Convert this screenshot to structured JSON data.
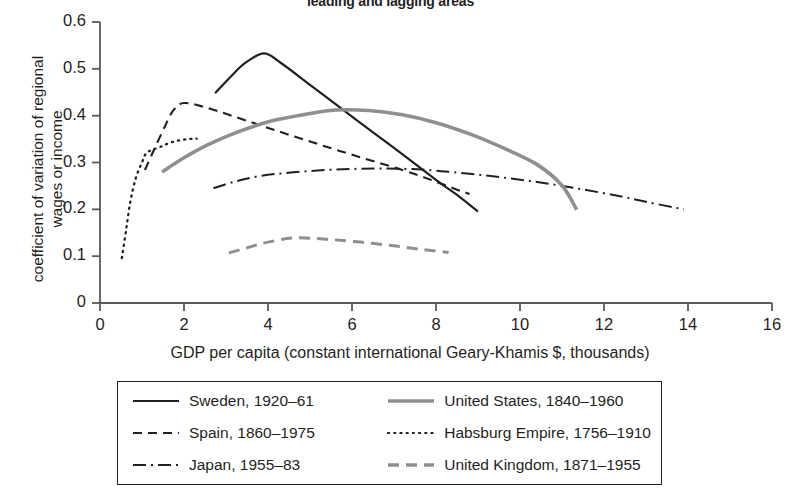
{
  "chart_data": {
    "type": "line",
    "title": "leading and lagging areas",
    "xlabel": "GDP per capita (constant international Geary-Khamis $, thousands)",
    "ylabel_line1": "coefficient of variation of regional",
    "ylabel_line2": "wages or income",
    "xlim": [
      0,
      16
    ],
    "ylim": [
      0,
      0.6
    ],
    "xticks": [
      "0",
      "2",
      "4",
      "6",
      "8",
      "10",
      "12",
      "14",
      "16"
    ],
    "xtick_values": [
      0,
      2,
      4,
      6,
      8,
      10,
      12,
      14,
      16
    ],
    "yticks": [
      "0",
      "0.1",
      "0.2",
      "0.3",
      "0.4",
      "0.5",
      "0.6"
    ],
    "ytick_values": [
      0,
      0.1,
      0.2,
      0.3,
      0.4,
      0.5,
      0.6
    ],
    "grid": false,
    "legend_position": "below-axes",
    "series": [
      {
        "name": "Sweden, 1920–61",
        "style": "solid",
        "color": "#231f20",
        "width": 2.2,
        "points": [
          [
            2.74,
            0.448
          ],
          [
            3.1,
            0.482
          ],
          [
            3.45,
            0.512
          ],
          [
            3.9,
            0.533
          ],
          [
            4.3,
            0.513
          ],
          [
            5.0,
            0.466
          ],
          [
            6.0,
            0.398
          ],
          [
            7.0,
            0.331
          ],
          [
            8.0,
            0.263
          ],
          [
            8.6,
            0.224
          ],
          [
            9.0,
            0.195
          ]
        ]
      },
      {
        "name": "Spain, 1860–1975",
        "style": "dashed",
        "color": "#231f20",
        "width": 2.1,
        "points": [
          [
            1.07,
            0.284
          ],
          [
            1.3,
            0.33
          ],
          [
            1.55,
            0.378
          ],
          [
            1.75,
            0.412
          ],
          [
            2.0,
            0.427
          ],
          [
            2.5,
            0.418
          ],
          [
            3.2,
            0.398
          ],
          [
            4.2,
            0.368
          ],
          [
            5.2,
            0.339
          ],
          [
            6.2,
            0.311
          ],
          [
            7.2,
            0.284
          ],
          [
            8.0,
            0.259
          ],
          [
            8.5,
            0.242
          ],
          [
            8.8,
            0.233
          ]
        ]
      },
      {
        "name": "Japan, 1955–83",
        "style": "dashdot",
        "color": "#231f20",
        "width": 2.0,
        "points": [
          [
            2.7,
            0.245
          ],
          [
            3.2,
            0.259
          ],
          [
            3.8,
            0.271
          ],
          [
            4.6,
            0.279
          ],
          [
            5.6,
            0.285
          ],
          [
            6.6,
            0.287
          ],
          [
            7.4,
            0.286
          ],
          [
            8.2,
            0.281
          ],
          [
            9.2,
            0.272
          ],
          [
            10.2,
            0.261
          ],
          [
            11.2,
            0.247
          ],
          [
            12.2,
            0.231
          ],
          [
            13.0,
            0.216
          ],
          [
            13.9,
            0.2
          ]
        ]
      },
      {
        "name": "United States, 1840–1960",
        "style": "solid",
        "color": "#8f8f8f",
        "width": 3.6,
        "points": [
          [
            1.48,
            0.28
          ],
          [
            2.0,
            0.31
          ],
          [
            2.6,
            0.339
          ],
          [
            3.3,
            0.366
          ],
          [
            4.1,
            0.389
          ],
          [
            4.9,
            0.403
          ],
          [
            5.6,
            0.412
          ],
          [
            6.4,
            0.411
          ],
          [
            7.2,
            0.402
          ],
          [
            8.0,
            0.385
          ],
          [
            8.8,
            0.361
          ],
          [
            9.6,
            0.331
          ],
          [
            10.4,
            0.296
          ],
          [
            11.0,
            0.251
          ],
          [
            11.35,
            0.199
          ]
        ]
      },
      {
        "name": "Habsburg Empire, 1756–1910",
        "style": "dotted",
        "color": "#231f20",
        "width": 2.3,
        "points": [
          [
            0.52,
            0.096
          ],
          [
            0.62,
            0.155
          ],
          [
            0.72,
            0.215
          ],
          [
            0.85,
            0.266
          ],
          [
            1.0,
            0.3
          ],
          [
            1.1,
            0.32
          ],
          [
            1.25,
            0.327
          ],
          [
            1.45,
            0.334
          ],
          [
            1.7,
            0.343
          ],
          [
            2.0,
            0.349
          ],
          [
            2.3,
            0.351
          ]
        ]
      },
      {
        "name": "United Kingdom, 1871–1955",
        "style": "dashed",
        "color": "#8f8f8f",
        "width": 3.0,
        "points": [
          [
            3.07,
            0.107
          ],
          [
            3.5,
            0.118
          ],
          [
            4.0,
            0.13
          ],
          [
            4.65,
            0.139
          ],
          [
            5.4,
            0.136
          ],
          [
            6.2,
            0.13
          ],
          [
            7.0,
            0.122
          ],
          [
            7.7,
            0.114
          ],
          [
            8.3,
            0.108
          ]
        ]
      }
    ]
  },
  "legend": {
    "items": [
      {
        "label": "Sweden, 1920–61",
        "style": "solid",
        "color": "#231f20"
      },
      {
        "label": "United States, 1840–1960",
        "style": "solid",
        "color": "#8f8f8f"
      },
      {
        "label": "Spain, 1860–1975",
        "style": "dashed",
        "color": "#231f20"
      },
      {
        "label": "Habsburg Empire, 1756–1910",
        "style": "dotted",
        "color": "#231f20"
      },
      {
        "label": "Japan, 1955–83",
        "style": "dashdot",
        "color": "#231f20"
      },
      {
        "label": "United Kingdom, 1871–1955",
        "style": "dashed",
        "color": "#8f8f8f"
      }
    ]
  },
  "axis": {
    "color": "#59595b"
  }
}
